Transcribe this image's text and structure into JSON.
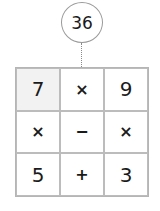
{
  "target": {
    "value": "36"
  },
  "grid": {
    "cells": [
      {
        "text": "7",
        "kind": "num",
        "shaded": true
      },
      {
        "text": "×",
        "kind": "op"
      },
      {
        "text": "9",
        "kind": "num"
      },
      {
        "text": "×",
        "kind": "op"
      },
      {
        "text": "−",
        "kind": "op"
      },
      {
        "text": "×",
        "kind": "op"
      },
      {
        "text": "5",
        "kind": "num"
      },
      {
        "text": "+",
        "kind": "op"
      },
      {
        "text": "3",
        "kind": "num"
      }
    ]
  }
}
